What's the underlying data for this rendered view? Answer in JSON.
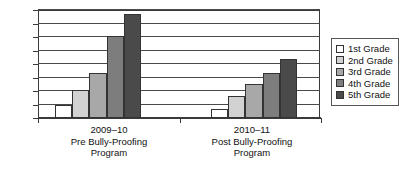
{
  "chart_data": {
    "type": "bar",
    "title": "",
    "xlabel": "",
    "ylabel": "",
    "ylim": [
      0,
      160
    ],
    "yticks": [
      0,
      20,
      40,
      60,
      80,
      100,
      120,
      140,
      160
    ],
    "grid": true,
    "legend_position": "right",
    "categories": [
      "2009–10 Pre Bully-Proofing Program",
      "2010–11 Post Bully-Proofing Program"
    ],
    "category_lines": [
      [
        "2009–10",
        "Pre Bully-Proofing",
        "Program"
      ],
      [
        "2010–11",
        "Post Bully-Proofing",
        "Program"
      ]
    ],
    "series": [
      {
        "name": "1st Grade",
        "color": "#ffffff",
        "values": [
          20,
          14
        ]
      },
      {
        "name": "2nd Grade",
        "color": "#d2d2d2",
        "values": [
          41,
          32
        ]
      },
      {
        "name": "3rd Grade",
        "color": "#a8a8a8",
        "values": [
          66,
          50
        ]
      },
      {
        "name": "4th Grade",
        "color": "#7d7d7d",
        "values": [
          121,
          66
        ]
      },
      {
        "name": "5th Grade",
        "color": "#4a4a4a",
        "values": [
          154,
          88
        ]
      }
    ]
  },
  "legend": {
    "items": [
      {
        "label": "1st Grade",
        "color": "#ffffff"
      },
      {
        "label": "2nd Grade",
        "color": "#d2d2d2"
      },
      {
        "label": "3rd Grade",
        "color": "#a8a8a8"
      },
      {
        "label": "4th Grade",
        "color": "#7d7d7d"
      },
      {
        "label": "5th Grade",
        "color": "#4a4a4a"
      }
    ]
  },
  "axis": {
    "y_tick_labels": [
      "160",
      "140",
      "120",
      "100",
      "80",
      "60",
      "40",
      "20",
      "0"
    ]
  }
}
